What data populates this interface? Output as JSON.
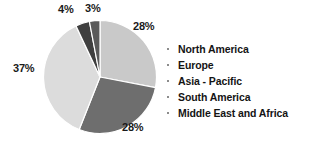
{
  "chart_data": {
    "type": "pie",
    "title": "",
    "subtitle": "",
    "xlabel": "",
    "ylabel": "",
    "grid": false,
    "legend_position": "right",
    "units": "percent",
    "start_angle_deg": 0,
    "direction": "clockwise",
    "categories": [
      "North America",
      "Europe",
      "Asia - Pacific",
      "South America",
      "Middle East and Africa"
    ],
    "values": [
      28,
      28,
      37,
      4,
      3
    ],
    "data_labels": [
      "28%",
      "28%",
      "37%",
      "4%",
      "3%"
    ],
    "slice_colors": [
      "#c9c9c9",
      "#6e6e6e",
      "#dcdcdc",
      "#3f3f3f",
      "#5a5a5a"
    ],
    "slices": [
      {
        "label": "North America",
        "value": 28,
        "display": "28%",
        "color": "#c9c9c9"
      },
      {
        "label": "Europe",
        "value": 28,
        "display": "28%",
        "color": "#6e6e6e"
      },
      {
        "label": "Asia - Pacific",
        "value": 37,
        "display": "37%",
        "color": "#dcdcdc"
      },
      {
        "label": "South America",
        "value": 4,
        "display": "4%",
        "color": "#3f3f3f"
      },
      {
        "label": "Middle East and Africa",
        "value": 3,
        "display": "3%",
        "color": "#5a5a5a"
      }
    ]
  },
  "labels": {
    "north_america_pct": "28%",
    "europe_pct": "28%",
    "asia_pacific_pct": "37%",
    "south_america_pct": "4%",
    "mea_pct": "3%"
  },
  "legend": {
    "items": [
      {
        "label": "North America"
      },
      {
        "label": "Europe"
      },
      {
        "label": "Asia - Pacific"
      },
      {
        "label": "South America"
      },
      {
        "label": "Middle East and Africa"
      }
    ]
  },
  "colors": {
    "background": "#ffffff",
    "label_text": "#1a1a1a",
    "legend_text": "#141414",
    "legend_bullet": "#8c8c8c",
    "slice_separator": "#ffffff"
  }
}
